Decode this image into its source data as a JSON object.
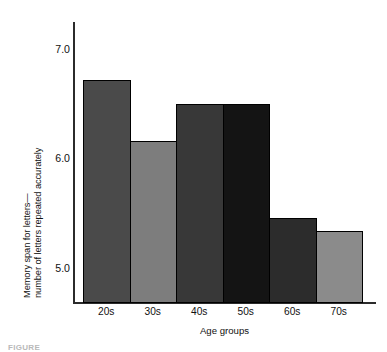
{
  "chart_data": {
    "type": "bar",
    "title": "",
    "subtitle": "",
    "xlabel": "Age groups",
    "ylabel": "Memory span for letters—number of letters repeated accurately",
    "ylabel_line1": "Memory span for letters—",
    "ylabel_line2": "number of letters repeated accurately",
    "categories": [
      "20s",
      "30s",
      "40s",
      "50s",
      "60s",
      "70s"
    ],
    "values": [
      6.72,
      6.16,
      6.5,
      6.5,
      5.46,
      5.34
    ],
    "bar_colors": [
      "#4a4a4a",
      "#7d7d7d",
      "#383838",
      "#141414",
      "#2c2c2c",
      "#8b8b8b"
    ],
    "bar_border_color": "#000000",
    "axis_color": "#2b2b2b",
    "background": "#ffffff",
    "ylim": [
      4.68,
      7.25
    ],
    "ytick_values": [
      7.0,
      6.0,
      5.0
    ],
    "ytick_labels": [
      "7.0",
      "6.0",
      "5.0"
    ],
    "grid": false,
    "legend": null,
    "legend_position": "none",
    "baseline_value": 4.68
  },
  "caption": {
    "text": "FIGURE"
  }
}
